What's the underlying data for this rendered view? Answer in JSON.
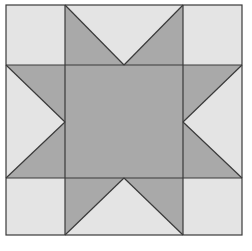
{
  "diagram": {
    "type": "quilt-block",
    "pattern": "sawtooth-star",
    "grid": "3x3",
    "colors": {
      "background": "#ffffff",
      "light": "#e4e4e4",
      "dark": "#a9a9a9",
      "line": "#3a3a3a"
    },
    "bounds": {
      "left": 6,
      "top": 5,
      "right": 242,
      "bottom": 235
    },
    "grid_lines": {
      "x": [
        65,
        183
      ],
      "y": [
        65,
        178
      ]
    },
    "star_points": {
      "top": [
        124,
        64
      ],
      "right": [
        184,
        122
      ],
      "bottom": [
        124,
        178
      ],
      "left": [
        64,
        122
      ]
    }
  }
}
